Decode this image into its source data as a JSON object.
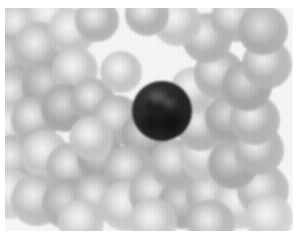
{
  "image": {
    "kind": "photomicrograph",
    "subject": "peripheral blood smear",
    "modality": "brightfield light microscopy",
    "color_mode": "grayscale",
    "caption": "",
    "background_color": "#f7f7f6",
    "page_color": "#ffffff",
    "plate": {
      "x": 5,
      "y": 8,
      "width": 288,
      "height": 223
    }
  },
  "palette": {
    "background": "#f7f7f6",
    "erythrocyte_mid": "#b2b2b0",
    "erythrocyte_dense": "#a6a6a4",
    "erythrocyte_pale": "#c4c4c2",
    "erythrocyte_center": "#f0f0ee",
    "leukocyte_nucleus": "#222220",
    "leukocyte_rim": "#343432"
  },
  "cells": {
    "leukocyte": {
      "label": "lymphocyte",
      "cx": 157,
      "cy": 103,
      "r": 30
    },
    "erythrocytes": [
      {
        "cx": 14,
        "cy": 18,
        "r": 24,
        "tone": "mid"
      },
      {
        "cx": 44,
        "cy": 8,
        "r": 23,
        "tone": "pale"
      },
      {
        "cx": 2,
        "cy": 52,
        "r": 25,
        "tone": "dense"
      },
      {
        "cx": 34,
        "cy": 40,
        "r": 26,
        "tone": "mid"
      },
      {
        "cx": 66,
        "cy": 24,
        "r": 24,
        "tone": "pale"
      },
      {
        "cx": 92,
        "cy": 12,
        "r": 22,
        "tone": "mid"
      },
      {
        "cx": 8,
        "cy": 86,
        "r": 25,
        "tone": "mid"
      },
      {
        "cx": 42,
        "cy": 78,
        "r": 25,
        "tone": "dense"
      },
      {
        "cx": 70,
        "cy": 62,
        "r": 23,
        "tone": "pale"
      },
      {
        "cx": 2,
        "cy": 120,
        "r": 24,
        "tone": "pale"
      },
      {
        "cx": 30,
        "cy": 112,
        "r": 24,
        "tone": "mid"
      },
      {
        "cx": 60,
        "cy": 100,
        "r": 24,
        "tone": "dense"
      },
      {
        "cx": 88,
        "cy": 92,
        "r": 22,
        "tone": "mid"
      },
      {
        "cx": 112,
        "cy": 112,
        "r": 25,
        "tone": "mid"
      },
      {
        "cx": 140,
        "cy": 128,
        "r": 24,
        "tone": "dense"
      },
      {
        "cx": 8,
        "cy": 152,
        "r": 25,
        "tone": "mid"
      },
      {
        "cx": 40,
        "cy": 146,
        "r": 24,
        "tone": "pale"
      },
      {
        "cx": 66,
        "cy": 160,
        "r": 25,
        "tone": "mid"
      },
      {
        "cx": 96,
        "cy": 150,
        "r": 24,
        "tone": "dense"
      },
      {
        "cx": 124,
        "cy": 162,
        "r": 25,
        "tone": "mid"
      },
      {
        "cx": 4,
        "cy": 186,
        "r": 25,
        "tone": "pale"
      },
      {
        "cx": 32,
        "cy": 192,
        "r": 26,
        "tone": "mid"
      },
      {
        "cx": 62,
        "cy": 196,
        "r": 25,
        "tone": "dense"
      },
      {
        "cx": 92,
        "cy": 190,
        "r": 24,
        "tone": "mid"
      },
      {
        "cx": 120,
        "cy": 198,
        "r": 25,
        "tone": "pale"
      },
      {
        "cx": 150,
        "cy": 186,
        "r": 26,
        "tone": "mid"
      },
      {
        "cx": 178,
        "cy": 196,
        "r": 25,
        "tone": "dense"
      },
      {
        "cx": 206,
        "cy": 188,
        "r": 25,
        "tone": "mid"
      },
      {
        "cx": 234,
        "cy": 196,
        "r": 25,
        "tone": "pale"
      },
      {
        "cx": 258,
        "cy": 182,
        "r": 26,
        "tone": "mid"
      },
      {
        "cx": 170,
        "cy": 156,
        "r": 25,
        "tone": "mid"
      },
      {
        "cx": 200,
        "cy": 148,
        "r": 25,
        "tone": "pale"
      },
      {
        "cx": 228,
        "cy": 156,
        "r": 25,
        "tone": "dense"
      },
      {
        "cx": 254,
        "cy": 142,
        "r": 25,
        "tone": "mid"
      },
      {
        "cx": 196,
        "cy": 118,
        "r": 25,
        "tone": "mid"
      },
      {
        "cx": 224,
        "cy": 110,
        "r": 24,
        "tone": "dense"
      },
      {
        "cx": 250,
        "cy": 112,
        "r": 25,
        "tone": "mid"
      },
      {
        "cx": 188,
        "cy": 82,
        "r": 23,
        "tone": "pale"
      },
      {
        "cx": 214,
        "cy": 66,
        "r": 25,
        "tone": "mid"
      },
      {
        "cx": 242,
        "cy": 78,
        "r": 25,
        "tone": "dense"
      },
      {
        "cx": 262,
        "cy": 56,
        "r": 25,
        "tone": "mid"
      },
      {
        "cx": 202,
        "cy": 30,
        "r": 25,
        "tone": "mid"
      },
      {
        "cx": 172,
        "cy": 14,
        "r": 24,
        "tone": "pale"
      },
      {
        "cx": 230,
        "cy": 10,
        "r": 24,
        "tone": "mid"
      },
      {
        "cx": 258,
        "cy": 22,
        "r": 25,
        "tone": "dense"
      },
      {
        "cx": 142,
        "cy": 6,
        "r": 22,
        "tone": "mid"
      },
      {
        "cx": 116,
        "cy": 64,
        "r": 21,
        "tone": "pale"
      },
      {
        "cx": 86,
        "cy": 130,
        "r": 22,
        "tone": "pale"
      },
      {
        "cx": 148,
        "cy": 214,
        "r": 24,
        "tone": "pale"
      },
      {
        "cx": 206,
        "cy": 216,
        "r": 24,
        "tone": "mid"
      },
      {
        "cx": 76,
        "cy": 214,
        "r": 23,
        "tone": "pale"
      },
      {
        "cx": 264,
        "cy": 210,
        "r": 24,
        "tone": "pale"
      }
    ]
  }
}
